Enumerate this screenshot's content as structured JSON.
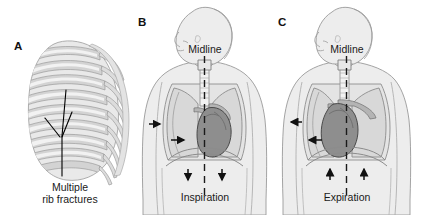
{
  "figure": {
    "background_color": "#ffffff",
    "width": 421,
    "height": 215
  },
  "palette": {
    "body_fill": "#ededed",
    "body_outline": "#9a9a9a",
    "lung_fill": "#d8d8d8",
    "lung_outline": "#8c8c8c",
    "heart_fill": "#8e8e8e",
    "heart_outline": "#4a4a4a",
    "rib_fill": "#d0d0d0",
    "rib_highlight": "#f4f4f4",
    "rib_outline": "#8d8d8d",
    "arrow_color": "#111111",
    "midline_color": "#1a1a1a",
    "text_color": "#1a1a1a",
    "fracture_line_color": "#000000"
  },
  "panels": [
    {
      "id": "A",
      "letter": "A",
      "caption": "Multiple rib fractures",
      "caption_lines": [
        "Multiple",
        "rib fractures"
      ],
      "content": "rib-cage-with-fractures",
      "fracture_count": 3
    },
    {
      "id": "B",
      "letter": "B",
      "midline_label": "Midline",
      "caption": "Inspiration",
      "content": "torso-thorax-mediastinal-shift",
      "chest_arrow_direction": "right",
      "chest_arrow_count": 2,
      "diaphragm_arrow_direction": "down",
      "diaphragm_arrow_count": 2,
      "heart_shift": "right-of-midline"
    },
    {
      "id": "C",
      "letter": "C",
      "midline_label": "Midline",
      "caption": "Expiration",
      "content": "torso-thorax-mediastinal-shift",
      "chest_arrow_direction": "left",
      "chest_arrow_count": 2,
      "diaphragm_arrow_direction": "up",
      "diaphragm_arrow_count": 2,
      "heart_shift": "left-of-midline"
    }
  ]
}
